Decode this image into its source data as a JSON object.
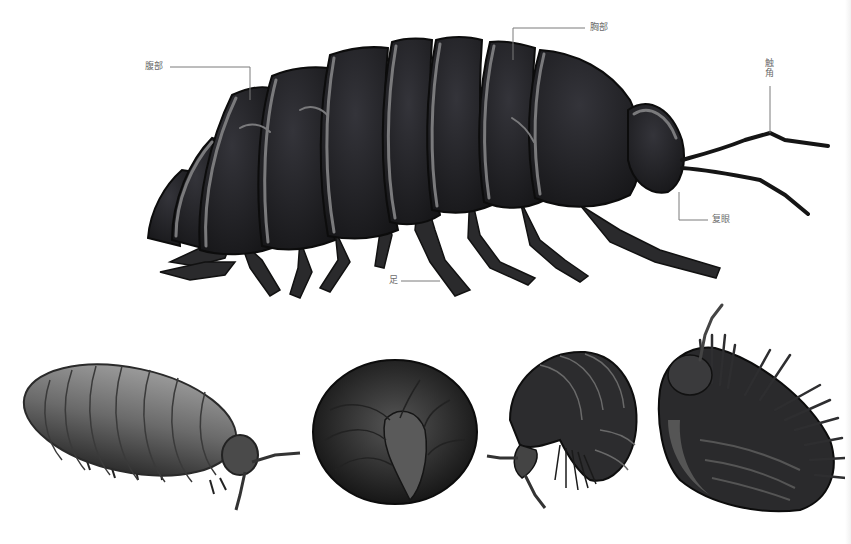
{
  "figure": {
    "colors": {
      "background": "#ffffff",
      "body_dark": "#1e1e20",
      "plate_outline": "#6e6e70",
      "highlight": "#8c8c8e",
      "leader_line": "#7a7a7a",
      "label_text": "#6b6b6b"
    }
  },
  "labels": {
    "abdomen": "腹部",
    "thorax": "胸部",
    "antenna": "触角",
    "compound_eye": "复眼",
    "leg": "足"
  },
  "poses": [
    {
      "name": "walking-side-view"
    },
    {
      "name": "fully-rolled-ball"
    },
    {
      "name": "half-rolled"
    },
    {
      "name": "underside-view"
    }
  ]
}
